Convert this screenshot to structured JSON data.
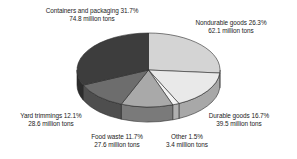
{
  "chart_data": {
    "type": "pie",
    "title": "",
    "subtitle": "",
    "xlabel": "",
    "ylabel": "",
    "legend_position": "none",
    "grid": false,
    "three_d": true,
    "units": "million tons",
    "total_value": 236.0,
    "categories": [
      "Nondurable goods",
      "Durable goods",
      "Other",
      "Food waste",
      "Yard trimmings",
      "Containers and packaging"
    ],
    "values": [
      26.3,
      16.7,
      1.5,
      11.7,
      12.1,
      31.7
    ],
    "tons": [
      62.1,
      39.5,
      3.4,
      27.6,
      28.6,
      74.8
    ],
    "colors": [
      "#d4d4d4",
      "#e9e9e9",
      "#f4f4f4",
      "#a9a9a9",
      "#6d6d6d",
      "#3d3d3d"
    ],
    "slices": [
      {
        "name": "Nondurable goods",
        "percent": 26.3,
        "tons": 62.1,
        "color": "#d4d4d4",
        "label_line1": "Nondurable goods 26.3%",
        "label_line2": "62.1 million tons"
      },
      {
        "name": "Durable goods",
        "percent": 16.7,
        "tons": 39.5,
        "color": "#e9e9e9",
        "label_line1": "Durable goods 16.7%",
        "label_line2": "39.5 million tons"
      },
      {
        "name": "Other",
        "percent": 1.5,
        "tons": 3.4,
        "color": "#f4f4f4",
        "label_line1": "Other 1.5%",
        "label_line2": "3.4 million tons"
      },
      {
        "name": "Food waste",
        "percent": 11.7,
        "tons": 27.6,
        "color": "#a9a9a9",
        "label_line1": "Food waste 11.7%",
        "label_line2": "27.6 million tons"
      },
      {
        "name": "Yard trimmings",
        "percent": 12.1,
        "tons": 28.6,
        "color": "#6d6d6d",
        "label_line1": "Yard trimmings 12.1%",
        "label_line2": "28.6 million tons"
      },
      {
        "name": "Containers and packaging",
        "percent": 31.7,
        "tons": 74.8,
        "color": "#3d3d3d",
        "label_line1": "Containers and packaging 31.7%",
        "label_line2": "74.8 million tons"
      }
    ]
  },
  "labels": {
    "containers": {
      "line1": "Containers and packaging 31.7%",
      "line2": "74.8 million tons"
    },
    "nondurable": {
      "line1": "Nondurable goods 26.3%",
      "line2": "62.1 million tons"
    },
    "durable": {
      "line1": "Durable goods 16.7%",
      "line2": "39.5 million tons"
    },
    "other": {
      "line1": "Other 1.5%",
      "line2": "3.4 million tons"
    },
    "food_waste": {
      "line1": "Food waste 11.7%",
      "line2": "27.6 million tons"
    },
    "yard_trimmings": {
      "line1": "Yard trimmings 12.1%",
      "line2": "28.6 million tons"
    }
  }
}
